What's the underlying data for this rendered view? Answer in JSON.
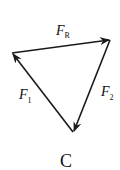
{
  "diagram": {
    "type": "force-vector-triangle",
    "option_label": "C",
    "vectors": [
      {
        "name": "F_R",
        "label": "F",
        "subscript": "R",
        "from": "left",
        "to": "right"
      },
      {
        "name": "F_2",
        "label": "F",
        "subscript": "2",
        "from": "right",
        "to": "bottom"
      },
      {
        "name": "F_1",
        "label": "F",
        "subscript": "1",
        "from": "bottom",
        "to": "left"
      }
    ],
    "vertices": {
      "left": [
        12,
        53
      ],
      "right": [
        110,
        40
      ],
      "bottom": [
        73,
        132
      ]
    },
    "stroke_color": "#1a1a1a"
  }
}
